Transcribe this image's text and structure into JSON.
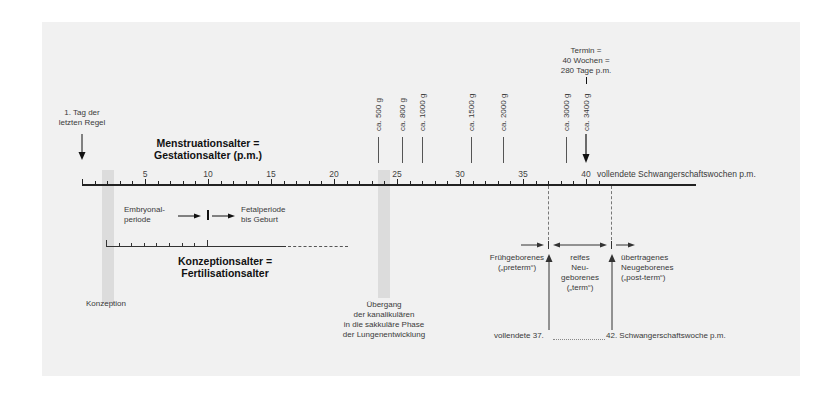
{
  "diagram": {
    "top_axis": {
      "title_line1": "Menstruationsalter =",
      "title_line2": "Gestationsalter (p.m.)",
      "unit_label": "vollendete Schwangerschaftswochen p.m.",
      "tick_labels": [
        "5",
        "10",
        "15",
        "20",
        "25",
        "30",
        "35",
        "40"
      ],
      "range_weeks": [
        0,
        48
      ]
    },
    "start_marker": {
      "line1": "1. Tag der",
      "line2": "letzten Regel"
    },
    "due_date": {
      "line1": "Termin =",
      "line2": "40 Wochen =",
      "line3": "280 Tage p.m."
    },
    "weights": [
      {
        "week": 23.5,
        "label": "ca. 500 g"
      },
      {
        "week": 25.4,
        "label": "ca. 800 g"
      },
      {
        "week": 27,
        "label": "ca. 1000 g"
      },
      {
        "week": 30.9,
        "label": "ca. 1500 g"
      },
      {
        "week": 33.4,
        "label": "ca. 2000 g"
      },
      {
        "week": 38.4,
        "label": "ca. 3000 g"
      },
      {
        "week": 40,
        "label": "ca. 3400 g"
      }
    ],
    "periods": {
      "embryonal_line1": "Embryonal-",
      "embryonal_line2": "periode",
      "fetal_line1": "Fetalperiode",
      "fetal_line2": "bis Geburt"
    },
    "bottom_axis": {
      "title_line1": "Konzeptionsalter =",
      "title_line2": "Fertilisationsalter"
    },
    "conception_label": "Konzeption",
    "lung_transition": {
      "line1": "Übergang",
      "line2": "der kanalikulären",
      "line3": "in die sakkuläre Phase",
      "line4": "der Lungenentwicklung"
    },
    "birth_categories": {
      "preterm_line1": "Frühgeborenes",
      "preterm_line2": "(„preterm“)",
      "term_line1": "reifes",
      "term_line2": "Neu-",
      "term_line3": "geborenes",
      "term_line4": "(„term“)",
      "postterm_line1": "übertragenes",
      "postterm_line2": "Neugeborenes",
      "postterm_line3": "(„post-term“)"
    },
    "week_boundaries": {
      "left": "vollendete 37.",
      "right": "42. Schwangerschaftswoche p.m."
    }
  }
}
